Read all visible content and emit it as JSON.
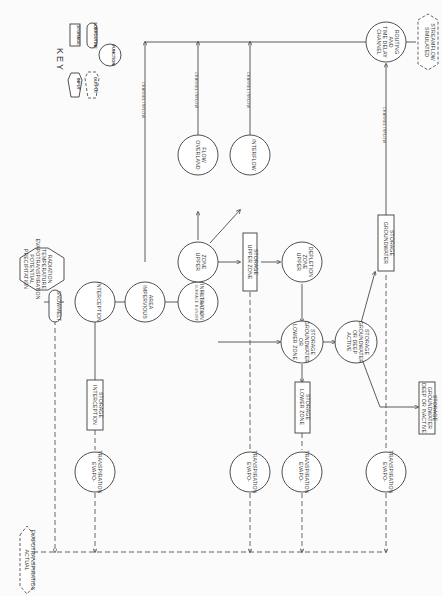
{
  "diagram": {
    "key": {
      "title": "KEY",
      "items": [
        {
          "shape": "rectangle",
          "label": "STORAGE"
        },
        {
          "shape": "rounded",
          "label": "SUBROUTINE"
        },
        {
          "shape": "circle",
          "label": "FUNCTION"
        },
        {
          "shape": "hexagon",
          "label": "INPUT"
        },
        {
          "shape": "dashed-hexagon",
          "label": "OUTPUT"
        }
      ]
    },
    "inputs": {
      "meteorological": [
        "PRECIPITATION",
        "POTENTIAL",
        "EVAPOTRANSPIRATION",
        "TEMPERATURE",
        "RADIATION"
      ]
    },
    "subroutines": {
      "snowmelt": "SNOWMELT"
    },
    "functions": {
      "interception": "INTERCEPTION",
      "impervious_area": [
        "IMPERVIOUS",
        "AREA"
      ],
      "infiltration": "INFILTRATION",
      "upper_zone": [
        "UPPER",
        "ZONE"
      ],
      "overland_flow": [
        "OVERLAND",
        "FLOW"
      ],
      "interflow": "INTERFLOW",
      "upper_zone_depletion": [
        "UPPER",
        "ZONE",
        "DEPLETION"
      ],
      "lower_zone": [
        "LOWER ZONE",
        "OR",
        "GROUNDWATER",
        "STORAGE"
      ],
      "active_groundwater": [
        "ACTIVE",
        "OR DEEP",
        "GROUNDWATER",
        "STORAGE"
      ],
      "channel_routing": [
        "CHANNEL",
        "TIME DELAY",
        "AND",
        "ROUTING"
      ],
      "evapotranspiration": [
        "EVAPO-",
        "TRANSPIRATION"
      ]
    },
    "storages": {
      "interception_storage": [
        "INTERCEPTION",
        "STORAGE"
      ],
      "upper_zone_storage": [
        "UPPER ZONE",
        "STORAGE"
      ],
      "lower_zone_storage": [
        "LOWER ZONE",
        "STORAGE"
      ],
      "groundwater_storage": [
        "GROUNDWATER",
        "STORAGE"
      ],
      "deep_inactive": [
        "DEEP OR INACTIVE",
        "GROUNDWATER",
        "STORAGE"
      ]
    },
    "outputs": {
      "actual_et": [
        "ACTUAL",
        "EVAPOTRANSPIRATION"
      ],
      "simulated_streamflow": [
        "SIMULATED",
        "STREAMFLOW"
      ]
    },
    "edge_labels": {
      "channel_inflow": "CHANNEL INFLOW",
      "surface_runoff": "SURFACE RUNOFF",
      "interflow_small": "INTERFLOW"
    }
  }
}
